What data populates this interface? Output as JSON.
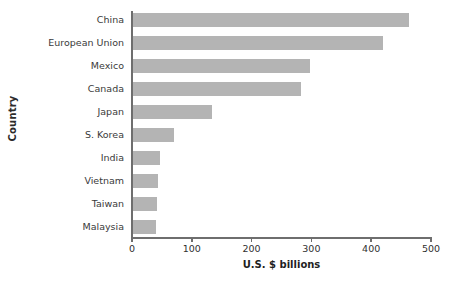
{
  "chart_data": {
    "type": "bar",
    "orientation": "horizontal",
    "title": "",
    "xlabel": "U.S. $ billions",
    "ylabel": "Country",
    "categories": [
      "China",
      "European Union",
      "Mexico",
      "Canada",
      "Japan",
      "S. Korea",
      "India",
      "Vietnam",
      "Taiwan",
      "Malaysia"
    ],
    "values": [
      463,
      419,
      298,
      283,
      134,
      70,
      47,
      43,
      42,
      40
    ],
    "xlim": [
      0,
      500
    ],
    "xticks": [
      0,
      100,
      200,
      300,
      400,
      500
    ],
    "xtick_labels": [
      "0",
      "100",
      "200",
      "300",
      "400",
      "500"
    ],
    "grid": false,
    "legend": false,
    "bar_color": "#b4b4b4",
    "axis_color": "#6e6e6e",
    "background": "#ffffff"
  }
}
